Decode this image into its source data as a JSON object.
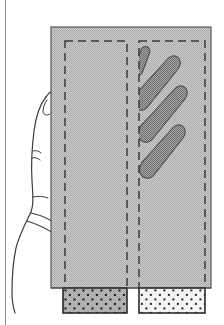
{
  "figure": {
    "caption_hidden": "",
    "ghost_text": {
      "line1": "",
      "line2": "",
      "line3": "",
      "line4": ""
    },
    "colors": {
      "background": "#ffffff",
      "device_fill": "#bfbfbf",
      "device_stroke": "#4a4a4a",
      "compartment_dash": "#3a3a3a",
      "finger_fill": "#8e8e8e",
      "finger_stroke": "#4a4a4a",
      "sample_left_fill": "#9f9f9f",
      "sample_right_fill": "#f2f2f2",
      "sample_stroke": "#2b2b2b",
      "speckle": "#2b2b2b",
      "hand_stroke": "#3c3c3c",
      "hand_fill": "#ffffff",
      "page_edge": "#8d8d8d"
    },
    "geometry": {
      "device_body": {
        "x": 51,
        "y": 27,
        "width": 160,
        "height": 261
      },
      "compartment_left": {
        "x": 65,
        "y": 41,
        "width": 62,
        "height": 247
      },
      "compartment_right": {
        "x": 139,
        "y": 41,
        "width": 66,
        "height": 247
      },
      "sample_left": {
        "x": 63,
        "y": 288,
        "width": 64,
        "height": 25
      },
      "sample_right": {
        "x": 139,
        "y": 288,
        "width": 66,
        "height": 25
      }
    },
    "parts": {
      "device_label": "dual-compartment test chamber",
      "compartment_left_label": "empty compartment",
      "compartment_right_label": "compartment containing fingers",
      "sample_left_label": "dark speckled material sample",
      "sample_right_label": "light speckled material sample",
      "hand_label": "hand inserted into chamber",
      "finger_count": 4
    },
    "fingers": [
      {
        "index": 1,
        "tip_x": 145,
        "tip_y": 49,
        "base_x": 140,
        "base_y": 68,
        "width": 9,
        "angle": -68
      },
      {
        "index": 2,
        "tip_x": 177,
        "tip_y": 63,
        "base_x": 142,
        "base_y": 103,
        "width": 17,
        "angle": -41
      },
      {
        "index": 3,
        "tip_x": 184,
        "tip_y": 92,
        "base_x": 143,
        "base_y": 136,
        "width": 17,
        "angle": -44
      },
      {
        "index": 4,
        "tip_x": 182,
        "tip_y": 131,
        "base_x": 146,
        "base_y": 172,
        "width": 17,
        "angle": -46
      }
    ]
  }
}
